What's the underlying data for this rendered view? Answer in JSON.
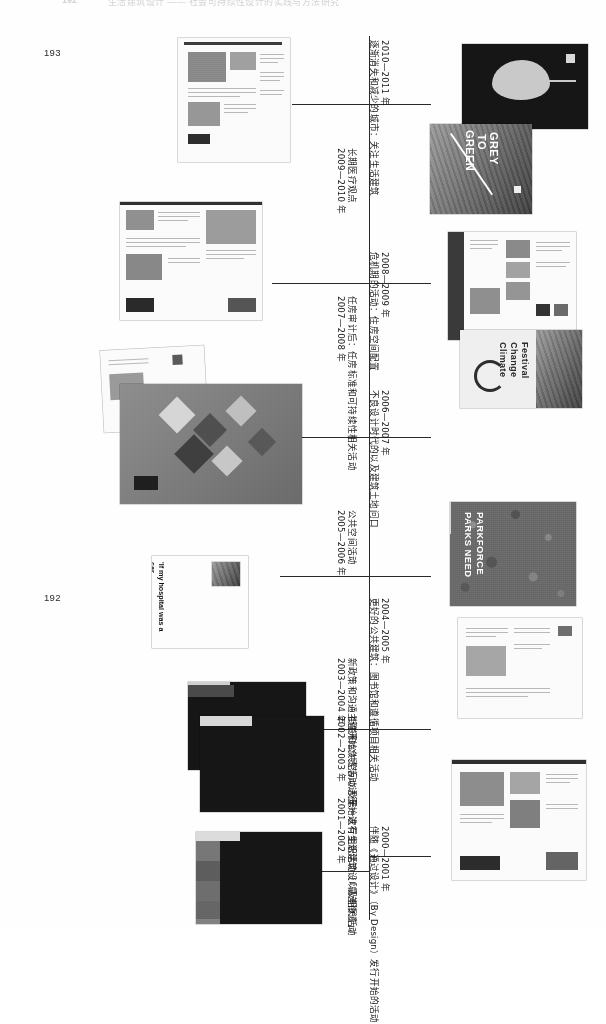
{
  "page": {
    "running_head_number": "192",
    "running_head_text": "生活建筑设计 —— 社会可持续性设计的实践与方法研究",
    "folio_left_top": "193",
    "folio_left_bottom": "192",
    "orientation": "landscape-rotated-90"
  },
  "timeline": {
    "axis_color": "#2a2a2a",
    "entries": [
      {
        "id": "e2010",
        "year": "2010—2011 年",
        "title": "逐渐消失和减少的城市：关注生活建筑",
        "top": 42,
        "label_x": 381,
        "label_y": 40,
        "tick_y": 104,
        "tick_side": "right"
      },
      {
        "id": "e2009",
        "year": "2009—2010 年",
        "title": "长期医疗观点",
        "top": 150,
        "label_x": 348,
        "label_y": 148,
        "tick_y": 104,
        "tick_side": "left"
      },
      {
        "id": "e2008",
        "year": "2008—2009 年",
        "title": "危机期的活动：住房空间配置",
        "top": 256,
        "label_x": 381,
        "label_y": 252,
        "tick_y": 283,
        "tick_side": "right"
      },
      {
        "id": "e2007",
        "year": "2007—2008 年",
        "title": "任房审计后：任房标准和可持续性相关活动",
        "top": 300,
        "label_x": 348,
        "label_y": 296,
        "tick_y": 283,
        "tick_side": "left"
      },
      {
        "id": "e2006",
        "year": "2006—2007 年",
        "title": "不良设计时代的以及建筑土地问口",
        "top": 392,
        "label_x": 381,
        "label_y": 390,
        "tick_y": 437,
        "tick_side": "right"
      },
      {
        "id": "e2005",
        "year": "2005—2006 年",
        "title": "公共空间活动",
        "top": 512,
        "label_x": 348,
        "label_y": 510,
        "tick_y": 437,
        "tick_side": "left"
      },
      {
        "id": "e2004",
        "year": "2004—2005 年",
        "title": "更好的公共建筑：图书馆和遵循项目相关活动",
        "top": 600,
        "label_x": 381,
        "label_y": 598,
        "tick_y": 576,
        "tick_side": "right"
      },
      {
        "id": "e2003",
        "year": "2003—2004 年",
        "title": "新政策和沟通主管开始负责活动进行",
        "top": 660,
        "label_x": 348,
        "label_y": 658,
        "tick_y": 576,
        "tick_side": "left"
      },
      {
        "id": "e2002",
        "year": "2002—2003 年",
        "title": "街道和公共空间以及第一次有组织活动（「最差街道」）",
        "top": 718,
        "label_x": 348,
        "label_y": 716,
        "tick_y": 729,
        "tick_side": "left"
      },
      {
        "id": "e2001",
        "year": "2001—2002 年",
        "title": "开始进行生活建筑设以及相关活动",
        "top": 800,
        "label_x": 348,
        "label_y": 798,
        "tick_y": 816,
        "tick_side": "left"
      },
      {
        "id": "e2000",
        "year": "2000—2001 年",
        "title": "伴随《通过设计》（By Design）发行开始的活动",
        "top": 828,
        "label_x": 381,
        "label_y": 826,
        "tick_y": 856,
        "tick_side": "right"
      }
    ]
  },
  "artwork": {
    "items": [
      {
        "id": "a-report-2010",
        "name": "report-spread-2010",
        "caption": "",
        "kind": "document-spread"
      },
      {
        "id": "a-leaf-cover",
        "name": "leaf-cover",
        "caption": "",
        "kind": "dark-cover-leaf"
      },
      {
        "id": "a-grey-to-green",
        "name": "grey-to-green-poster",
        "caption": "GREY TO GREEN",
        "kind": "photo-poster"
      },
      {
        "id": "a-report-2009",
        "name": "report-spread-2009",
        "caption": "",
        "kind": "document-spread"
      },
      {
        "id": "a-leaflet-2008",
        "name": "leaflet-spread-2008",
        "caption": "",
        "kind": "document-spread"
      },
      {
        "id": "a-climate-festival",
        "name": "climate-change-festival-poster",
        "caption": "Climate Change Festival",
        "kind": "photo-poster"
      },
      {
        "id": "a-design-review",
        "name": "design-review-cover",
        "caption": "",
        "kind": "illustration-cover"
      },
      {
        "id": "a-parkforce",
        "name": "parks-need-parkforce-poster",
        "caption": "PARKS NEED\nPARKFORCE",
        "kind": "photo-poster"
      },
      {
        "id": "a-quote-card",
        "name": "transit-van-quote-card",
        "caption": "'If my hospital was a car,\nI think it would be a\nTransit van – a bit old and\nknackered, but fits a lot\nin the back.'",
        "kind": "quote-card"
      },
      {
        "id": "a-report-2004",
        "name": "report-spread-2004",
        "caption": "",
        "kind": "document-spread"
      },
      {
        "id": "a-dark-cover-2002",
        "name": "dark-cover-2002",
        "caption": "",
        "kind": "dark-cover"
      },
      {
        "id": "a-bookgroup-2001",
        "name": "book-group-2001",
        "caption": "",
        "kind": "dark-cover-group"
      },
      {
        "id": "a-guide-2000",
        "name": "design-guide-spread-2000",
        "caption": "",
        "kind": "document-spread"
      }
    ],
    "grey_to_green_lines": [
      "GREY",
      "TO",
      "GREEN"
    ],
    "parkforce_lines": [
      "PARKS NEED",
      "PARKFORCE"
    ],
    "climate_lines": [
      "Climate",
      "Change",
      "Festival"
    ],
    "quote_lines": "'If my hospital was a car,\nI think it would be a\nTransit van – a bit old and\nknackered, but fits a lot\nin the back.'"
  }
}
